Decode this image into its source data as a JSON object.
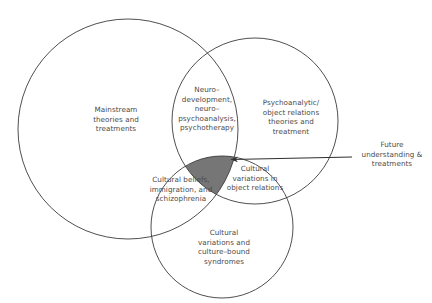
{
  "diagram": {
    "type": "venn",
    "title": "",
    "background_color": "#ffffff",
    "stroke_color": "#3b3b3b",
    "text_color": "#4a4a4a",
    "highlight_color": "#767676",
    "sets": [
      {
        "id": "mainstream",
        "label": "Mainstream\ntheories and\ntreatments",
        "cx": 128,
        "cy": 129,
        "r": 110
      },
      {
        "id": "psychoanalytic",
        "label": "Psychoanalytic/\nobject relations\ntheories and\ntreatment",
        "cx": 255,
        "cy": 121,
        "r": 83
      },
      {
        "id": "cultural",
        "label": "Cultural\nvariations and\nculture–bound\nsyndromes",
        "cx": 222,
        "cy": 227,
        "r": 71
      }
    ],
    "intersections": [
      {
        "id": "mainstream-psychoanalytic",
        "label": "Neuro–\ndevelopment,\nneuro–\npsychoanalysis,\npsychotherapy"
      },
      {
        "id": "mainstream-cultural",
        "label": "Cultural beliefs,\nimmigration, and\nschizophrenia"
      },
      {
        "id": "psychoanalytic-cultural",
        "label": "Cultural\nvariations in\nobject relations"
      },
      {
        "id": "all-three",
        "label": "",
        "shaded": true,
        "fill": "#767676"
      }
    ],
    "callout": {
      "label": "Future\nunderstanding &\ntreatments",
      "arrow": {
        "from_x": 352,
        "from_y": 157,
        "to_x": 227,
        "to_y": 160,
        "color": "#2f2f2f"
      }
    }
  }
}
